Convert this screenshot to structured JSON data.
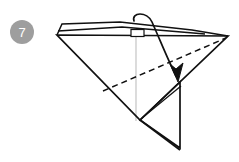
{
  "figure": {
    "kind": "origami-fold-diagram",
    "step_number": "7",
    "background_color": "#ffffff",
    "line_color": "#111111",
    "guide_color": "#b9b9b9",
    "badge_color": "#9a9a9a",
    "badge_text_color": "#ffffff"
  },
  "badge": {
    "label": "7",
    "cx": 22,
    "cy": 32,
    "r": 12
  },
  "geometry": {
    "top_left_vertex": [
      57,
      35
    ],
    "top_right_vertex": [
      228,
      36
    ],
    "bottom_vertex": [
      140,
      120
    ],
    "flap_tip": [
      178,
      148
    ],
    "fold_target": [
      178,
      80
    ],
    "sliver_upper_left": [
      58,
      25
    ],
    "sliver_peak": [
      113,
      22
    ],
    "dashed_fold_left": [
      103,
      91
    ],
    "dashed_fold_right": [
      226,
      38
    ],
    "guide_line_top": [
      136,
      36
    ],
    "guide_line_bottom": [
      136,
      120
    ],
    "tab_rect": [
      131,
      30,
      14,
      7
    ],
    "arrow_curve_start": [
      134,
      21
    ],
    "arrow_curve_end": [
      178,
      78
    ]
  },
  "elements": {
    "step_badge_name": "step-number-badge",
    "main_outline_name": "paper-outline",
    "dashed_fold_name": "valley-fold-dashed-line",
    "fold_arrow_name": "fold-direction-arrow",
    "guide_line_name": "vertical-guide-line",
    "flap_name": "lower-flap-shape",
    "sliver_name": "top-edge-sliver"
  }
}
